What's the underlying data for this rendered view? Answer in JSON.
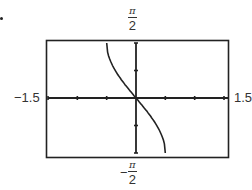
{
  "labels": {
    "ymax_num": "π",
    "ymax_den": "2",
    "ymin_sign": "−",
    "ymin_num": "π",
    "ymin_den": "2",
    "xmin": "−1.5",
    "xmax": "1.5"
  },
  "chart_data": {
    "type": "line",
    "title": "",
    "xlabel": "",
    "ylabel": "",
    "xlim": [
      -1.5,
      1.5
    ],
    "ylim": [
      -1.5708,
      1.5708
    ],
    "x_tick_step": 0.5,
    "y_tick_step": 0.7854,
    "grid": false,
    "series": [
      {
        "name": "y = -arcsin(2x)",
        "x": [
          -0.5,
          -0.45,
          -0.4,
          -0.3,
          -0.2,
          -0.1,
          0,
          0.1,
          0.2,
          0.3,
          0.4,
          0.45,
          0.5
        ],
        "values": [
          1.5708,
          1.1198,
          0.9273,
          0.6435,
          0.4115,
          0.2014,
          0,
          -0.2014,
          -0.4115,
          -0.6435,
          -0.9273,
          -1.1198,
          -1.5708
        ]
      }
    ]
  }
}
